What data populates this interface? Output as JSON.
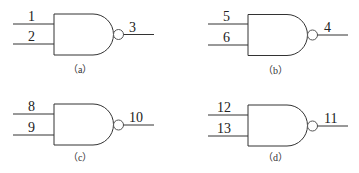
{
  "diagram": {
    "type": "logic-gates",
    "gates": [
      {
        "id": "a",
        "kind": "NAND",
        "inputs": [
          "1",
          "2"
        ],
        "output": "3",
        "caption": "（a）"
      },
      {
        "id": "b",
        "kind": "NAND",
        "inputs": [
          "5",
          "6"
        ],
        "output": "4",
        "caption": "（b）"
      },
      {
        "id": "c",
        "kind": "NAND",
        "inputs": [
          "8",
          "9"
        ],
        "output": "10",
        "caption": "（c）"
      },
      {
        "id": "d",
        "kind": "NAND",
        "inputs": [
          "12",
          "13"
        ],
        "output": "11",
        "caption": "（d）"
      }
    ]
  }
}
